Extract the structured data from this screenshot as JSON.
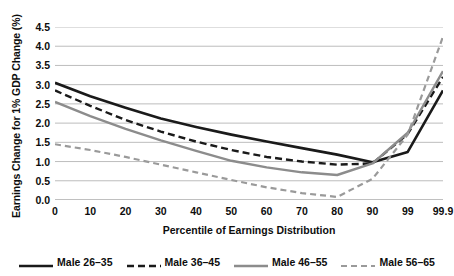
{
  "chart_data": {
    "type": "line",
    "title": "",
    "xlabel": "Percentile of Earnings Distribution",
    "ylabel": "Earnings Change for 1% GDP Change (%)",
    "categories": [
      "0",
      "10",
      "20",
      "30",
      "40",
      "50",
      "60",
      "70",
      "80",
      "90",
      "99",
      "99.9"
    ],
    "ylim": [
      0.0,
      4.5
    ],
    "ytick_step": 0.5,
    "yticks": [
      "0.0",
      "0.5",
      "1.0",
      "1.5",
      "2.0",
      "2.5",
      "3.0",
      "3.5",
      "4.0",
      "4.5"
    ],
    "grid": "horizontal",
    "legend_position": "bottom",
    "series": [
      {
        "name": "Male 26–35",
        "color": "#1a1a1a",
        "style": "solid",
        "width": 2.6,
        "values": [
          3.05,
          2.7,
          2.4,
          2.12,
          1.9,
          1.7,
          1.52,
          1.35,
          1.18,
          0.98,
          1.25,
          2.85
        ]
      },
      {
        "name": "Male 36–45",
        "color": "#1a1a1a",
        "style": "dashed",
        "width": 2.4,
        "values": [
          2.85,
          2.45,
          2.08,
          1.78,
          1.52,
          1.3,
          1.12,
          1.0,
          0.92,
          0.95,
          1.72,
          3.2
        ]
      },
      {
        "name": "Male 46–55",
        "color": "#8c8c8c",
        "style": "solid",
        "width": 2.4,
        "values": [
          2.55,
          2.18,
          1.85,
          1.55,
          1.28,
          1.02,
          0.85,
          0.72,
          0.65,
          0.95,
          1.75,
          3.35
        ]
      },
      {
        "name": "Male 56–65",
        "color": "#9a9a9a",
        "style": "dashed",
        "width": 2.2,
        "values": [
          1.45,
          1.3,
          1.12,
          0.92,
          0.72,
          0.52,
          0.33,
          0.18,
          0.08,
          0.55,
          1.7,
          4.25
        ]
      }
    ]
  },
  "axis": {
    "y_title": "Earnings Change for 1% GDP Change (%)",
    "x_title": "Percentile of Earnings Distribution"
  }
}
